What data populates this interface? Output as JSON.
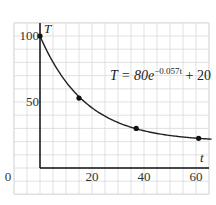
{
  "chart_data": {
    "type": "line",
    "title": "",
    "xlabel": "t",
    "ylabel": "T",
    "xlim": [
      -10,
      67
    ],
    "ylim": [
      -10,
      105
    ],
    "grid": true,
    "x_ticks": [
      0,
      20,
      40,
      60
    ],
    "y_ticks": [
      50,
      100
    ],
    "tick_labels": {
      "x": [
        "0",
        "20",
        "40",
        "60"
      ],
      "y": [
        "50",
        "100"
      ]
    },
    "annotation": {
      "lhs": "T = 80e",
      "exponent": "−0.057t",
      "rhs": " + 20"
    },
    "series": [
      {
        "name": "T = 80e^(-0.057t) + 20",
        "curve": {
          "a": 80,
          "k": -0.057,
          "c": 20,
          "t_range": [
            0,
            66
          ]
        },
        "points": [
          {
            "t": 0,
            "T": 100
          },
          {
            "t": 15,
            "T": 53
          },
          {
            "t": 37,
            "T": 30
          },
          {
            "t": 61,
            "T": 22.5
          }
        ]
      }
    ],
    "colors": {
      "grid": "#d9d9d9",
      "axis": "#111111",
      "curve": "#222222",
      "point": "#111111"
    }
  }
}
